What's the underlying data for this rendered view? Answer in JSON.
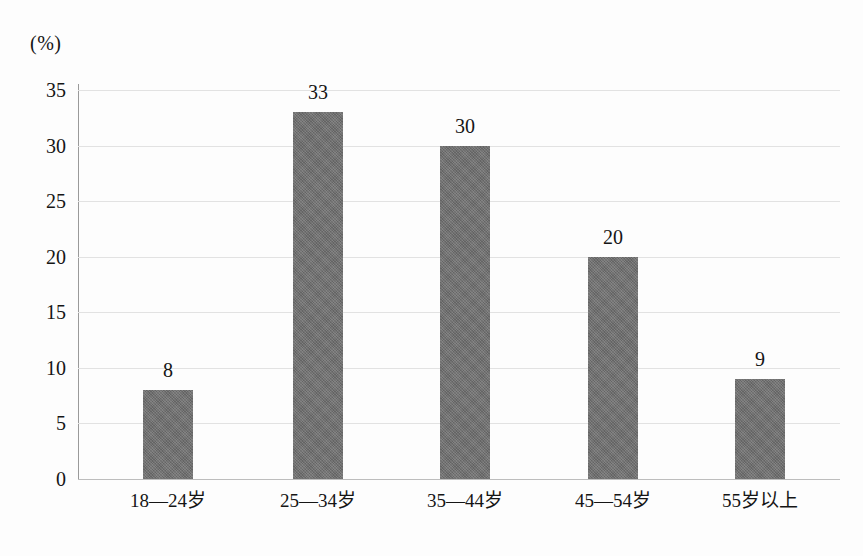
{
  "chart_data": {
    "type": "bar",
    "title": "",
    "subtitle": "",
    "xlabel": "",
    "ylabel": "(%)",
    "unit_label": "(%)",
    "categories": [
      "18—24岁",
      "25—34岁",
      "35—44岁",
      "45—54岁",
      "55岁以上"
    ],
    "values": [
      8,
      33,
      30,
      20,
      9
    ],
    "data_labels": [
      "8",
      "33",
      "30",
      "20",
      "9"
    ],
    "ylim": [
      0,
      35
    ],
    "y_ticks": [
      35,
      30,
      25,
      20,
      15,
      10,
      5,
      0
    ],
    "y_tick_labels": [
      "35",
      "30",
      "25",
      "20",
      "15",
      "10",
      "5",
      "0"
    ],
    "grid": true,
    "grid_axis": "y",
    "legend": false,
    "legend_position": "none",
    "series": [
      {
        "name": "",
        "values": [
          8,
          33,
          30,
          20,
          9
        ],
        "color": "#6b6b6b"
      }
    ]
  },
  "colors": {
    "bar_fill": "#6b6b6b",
    "gridline": "#e2e2e2",
    "axis_line": "#9a9a9a",
    "baseline": "#bdbdbd",
    "text": "#151515",
    "background": "#fdfdfd"
  }
}
